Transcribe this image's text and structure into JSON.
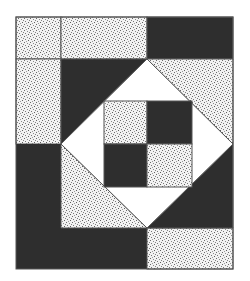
{
  "figure": {
    "type": "quilt-block",
    "colors": {
      "dark": "#2e2e2e",
      "speckle_base": "#f2f2f2",
      "speckle_dot": "#6a6a6a",
      "light": "#ffffff",
      "outline": "#555555"
    },
    "frame": {
      "x": 16,
      "y": 17,
      "width": 217,
      "height": 252
    },
    "grid": {
      "columns": [
        16,
        61,
        147,
        233
      ],
      "rows": [
        17,
        59,
        144,
        228,
        269
      ]
    },
    "pieces": [
      {
        "name": "top-left-square",
        "fill": "speckle"
      },
      {
        "name": "top-middle-rect",
        "fill": "speckle"
      },
      {
        "name": "top-right-rect",
        "fill": "dark"
      },
      {
        "name": "left-upper-rect",
        "fill": "speckle"
      },
      {
        "name": "left-lower-rect",
        "fill": "dark"
      },
      {
        "name": "bottom-left-rect",
        "fill": "dark"
      },
      {
        "name": "bottom-right-rect",
        "fill": "speckle"
      },
      {
        "name": "corner-triangle-top-left",
        "fill": "dark"
      },
      {
        "name": "corner-triangle-top-right",
        "fill": "speckle"
      },
      {
        "name": "corner-triangle-bottom-left",
        "fill": "speckle"
      },
      {
        "name": "corner-triangle-bottom-right",
        "fill": "dark"
      },
      {
        "name": "diamond",
        "fill": "light"
      },
      {
        "name": "four-patch-top-left",
        "fill": "speckle"
      },
      {
        "name": "four-patch-top-right",
        "fill": "dark"
      },
      {
        "name": "four-patch-bottom-left",
        "fill": "dark"
      },
      {
        "name": "four-patch-bottom-right",
        "fill": "speckle"
      }
    ]
  }
}
